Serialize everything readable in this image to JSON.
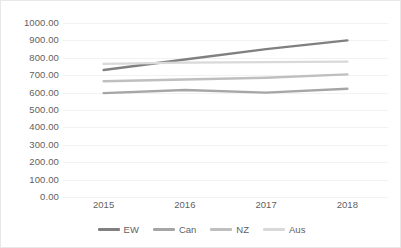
{
  "chart_data": {
    "type": "line",
    "title": "",
    "xlabel": "",
    "ylabel": "",
    "x": [
      "2015",
      "2016",
      "2017",
      "2018"
    ],
    "categories": [
      "2015",
      "2016",
      "2017",
      "2018"
    ],
    "xtick_labels": [
      "2015",
      "2016",
      "2017",
      "2018"
    ],
    "ytick_labels": [
      "1000.00",
      "900.00",
      "800.00",
      "700.00",
      "600.00",
      "500.00",
      "400.00",
      "300.00",
      "200.00",
      "100.00",
      "0.00"
    ],
    "ytick_values": [
      1000,
      900,
      800,
      700,
      600,
      500,
      400,
      300,
      200,
      100,
      0
    ],
    "ylim": [
      0,
      1000
    ],
    "grid": true,
    "legend_position": "bottom",
    "series": [
      {
        "name": "EW",
        "color": "#808080",
        "values": [
          730,
          790,
          850,
          900
        ]
      },
      {
        "name": "Can",
        "color": "#a6a6a6",
        "values": [
          597,
          615,
          600,
          622
        ]
      },
      {
        "name": "NZ",
        "color": "#bfbfbf",
        "values": [
          665,
          675,
          685,
          705
        ]
      },
      {
        "name": "Aus",
        "color": "#d9d9d9",
        "values": [
          765,
          772,
          775,
          778
        ]
      }
    ]
  },
  "legend": {
    "items": [
      {
        "label": "EW",
        "color": "#808080"
      },
      {
        "label": "Can",
        "color": "#a6a6a6"
      },
      {
        "label": "NZ",
        "color": "#bfbfbf"
      },
      {
        "label": "Aus",
        "color": "#d9d9d9"
      }
    ]
  },
  "axes": {
    "y": {
      "labels": [
        "1000.00",
        "900.00",
        "800.00",
        "700.00",
        "600.00",
        "500.00",
        "400.00",
        "300.00",
        "200.00",
        "100.00",
        "0.00"
      ]
    },
    "x": {
      "labels": [
        "2015",
        "2016",
        "2017",
        "2018"
      ]
    }
  },
  "colors": {
    "gridline": "#f2f2f2",
    "text": "#5f5f5f",
    "background": "#ffffff",
    "border": "#e8e8e8"
  }
}
